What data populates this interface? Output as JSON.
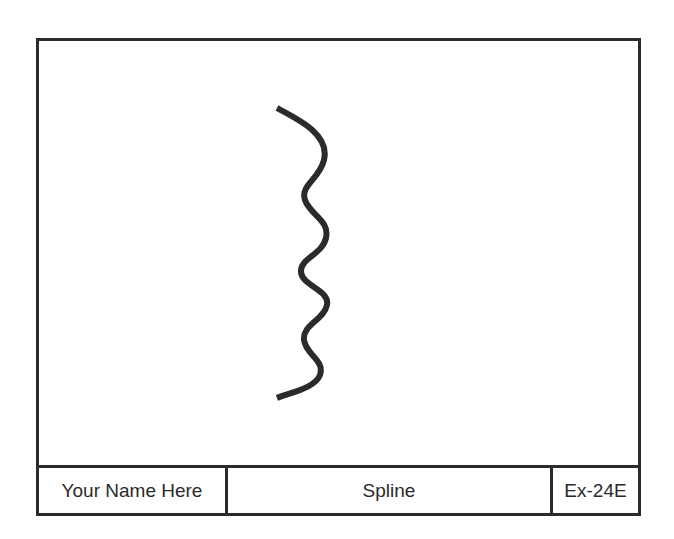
{
  "drawing": {
    "curve_name": "spline-curve",
    "stroke_color": "#2b2b2b",
    "stroke_width": 6,
    "points": [
      [
        277,
        108
      ],
      [
        324,
        155
      ],
      [
        305,
        192
      ],
      [
        328,
        230
      ],
      [
        301,
        265
      ],
      [
        328,
        297
      ],
      [
        304,
        335
      ],
      [
        322,
        370
      ],
      [
        277,
        398
      ]
    ]
  },
  "title_block": {
    "name": "Your Name Here",
    "title": "Spline",
    "number": "Ex-24E"
  },
  "colors": {
    "line": "#2b2b2b",
    "text": "#2a2a2a",
    "background": "#ffffff"
  }
}
